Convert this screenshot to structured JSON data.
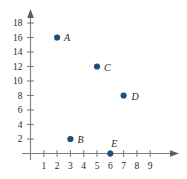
{
  "chart_data": {
    "type": "scatter",
    "title": "",
    "xlabel": "",
    "ylabel": "",
    "xlim": [
      0,
      9.8
    ],
    "ylim": [
      0,
      19.5
    ],
    "grid": false,
    "legend": null,
    "xticks": [
      1,
      2,
      3,
      4,
      5,
      6,
      7,
      8,
      9
    ],
    "yticks": [
      2,
      4,
      6,
      8,
      10,
      12,
      14,
      16,
      18
    ],
    "xtick_labels": [
      "1",
      "2",
      "3",
      "4",
      "5",
      "6",
      "7",
      "8",
      "9"
    ],
    "ytick_labels": [
      "2",
      "4",
      "6",
      "8",
      "10",
      "12",
      "14",
      "16",
      "18"
    ],
    "marker_color": "#1f4e79",
    "axis_color": "#7d7d7d",
    "points": [
      {
        "label": "A",
        "x": 2,
        "y": 16,
        "label_dx": 7,
        "label_dy": 3
      },
      {
        "label": "B",
        "x": 3,
        "y": 2,
        "label_dx": 7,
        "label_dy": 4
      },
      {
        "label": "C",
        "x": 5,
        "y": 12,
        "label_dx": 7,
        "label_dy": 4
      },
      {
        "label": "D",
        "x": 7,
        "y": 8,
        "label_dx": 8,
        "label_dy": 4
      },
      {
        "label": "E",
        "x": 6,
        "y": 0,
        "label_dx": 1,
        "label_dy": -7
      }
    ]
  }
}
